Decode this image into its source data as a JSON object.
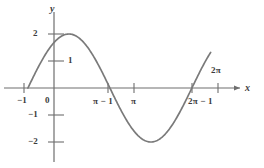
{
  "figure": {
    "kind": "math-function-graph",
    "background_color": "#ffffff",
    "curve_color": "#7a7a7a",
    "axis_color": "#6e6e6e",
    "text_color": "#3c3c3c"
  },
  "axes": {
    "x_axis_label": "x",
    "y_axis_label": "y",
    "x_ticks": [
      {
        "label": "−1",
        "position": "below-left",
        "x_value": -1
      },
      {
        "label": "0",
        "position": "below-right",
        "x_value": 0
      },
      {
        "label": "π − 1",
        "position": "below",
        "x_value": 2.1416
      },
      {
        "label": "π",
        "position": "below",
        "x_value": 3.1416
      },
      {
        "label": "2π − 1",
        "position": "below",
        "x_value": 5.2832
      },
      {
        "label": "2π",
        "position": "above",
        "x_value": 6.2832
      }
    ],
    "y_ticks": [
      {
        "label": "2",
        "y_value": 2
      },
      {
        "label": "1",
        "y_value": 1
      },
      {
        "label": "−1",
        "y_value": -1
      },
      {
        "label": "−2",
        "y_value": -2
      }
    ]
  },
  "chart_data": {
    "type": "line",
    "title": "",
    "subtitle": "",
    "xlabel": "x",
    "ylabel": "y",
    "xlim": [
      -1.6,
      7.6
    ],
    "ylim": [
      -2.6,
      2.6
    ],
    "grid": false,
    "legend": null,
    "series": [
      {
        "name": "y = 2 sin(x + 1)",
        "color": "#7a7a7a",
        "x": [
          -1.0,
          -0.8,
          -0.6,
          -0.4,
          -0.2,
          0.0,
          0.2,
          0.4,
          0.5708,
          0.8,
          1.0,
          1.2,
          1.4,
          1.6,
          1.8,
          2.0,
          2.1416,
          2.4,
          2.6,
          2.8,
          3.0,
          3.2,
          3.4,
          3.6,
          3.8,
          4.0,
          4.2,
          4.4,
          4.6,
          4.7124,
          5.0,
          5.2,
          5.2832,
          5.5,
          5.7,
          5.9
        ],
        "y": [
          0.0,
          0.397,
          0.779,
          1.131,
          1.438,
          1.683,
          1.859,
          1.956,
          2.0,
          1.927,
          1.819,
          1.653,
          1.437,
          1.176,
          0.879,
          0.557,
          0.3,
          -0.444,
          -0.837,
          -1.187,
          -1.483,
          -1.714,
          -1.874,
          -1.958,
          -1.963,
          -1.891,
          -1.743,
          -1.525,
          -1.246,
          -2.0,
          -0.443,
          -0.125,
          0.0,
          0.349,
          0.712,
          1.047
        ]
      }
    ],
    "annotations": [
      {
        "text": "curve zero crossings at x = −1, π−1, 2π−1"
      },
      {
        "text": "maximum value 2"
      },
      {
        "text": "minimum value −2"
      }
    ]
  }
}
